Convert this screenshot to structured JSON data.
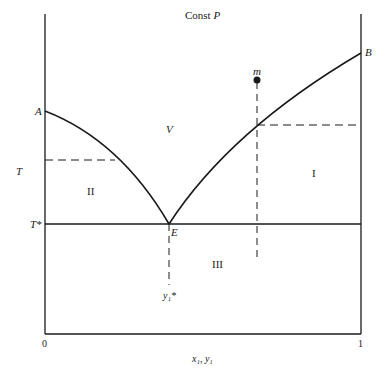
{
  "title": "Const",
  "title_var": "P",
  "axis": {
    "x_label": "x₁, y₁",
    "x_min_label": "0",
    "x_max_label": "1",
    "y_label": "T",
    "eutectic_temp_label": "T*"
  },
  "points": {
    "A": "A",
    "B": "B",
    "E": "E",
    "m": "m"
  },
  "regions": {
    "V": "V",
    "I": "I",
    "II": "II",
    "III": "III"
  },
  "eutectic_comp_label": "y₁*",
  "colors": {
    "line": "#1a1a1a",
    "background": "#ffffff"
  }
}
